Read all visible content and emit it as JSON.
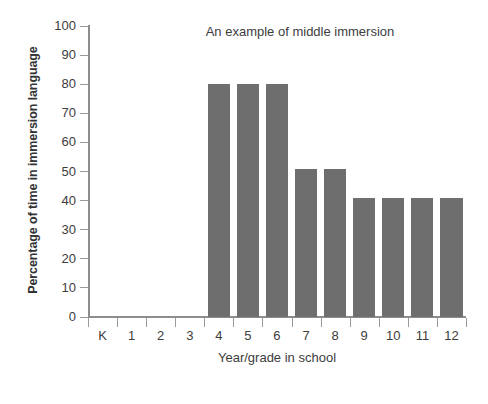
{
  "chart_data": {
    "type": "bar",
    "title": "An example of middle immersion",
    "xlabel": "Year/grade in school",
    "ylabel": "Percentage of time in immersion language",
    "categories": [
      "K",
      "1",
      "2",
      "3",
      "4",
      "5",
      "6",
      "7",
      "8",
      "9",
      "10",
      "11",
      "12"
    ],
    "values": [
      0,
      0,
      0,
      0,
      80,
      80,
      80,
      51,
      51,
      41,
      41,
      41,
      41
    ],
    "ylim": [
      0,
      100
    ],
    "ytick_labels": [
      "100",
      "90",
      "80",
      "70",
      "60",
      "50",
      "40",
      "30",
      "20",
      "10",
      "0"
    ],
    "ytick_values": [
      100,
      90,
      80,
      70,
      60,
      50,
      40,
      30,
      20,
      10,
      0
    ],
    "ytick_step": 10,
    "grid": false,
    "legend": false,
    "bar_color": "#6e6e6e",
    "axis_color": "#8d8d8d",
    "background_color": "#ffffff",
    "text_color": "#3d3d3d"
  }
}
